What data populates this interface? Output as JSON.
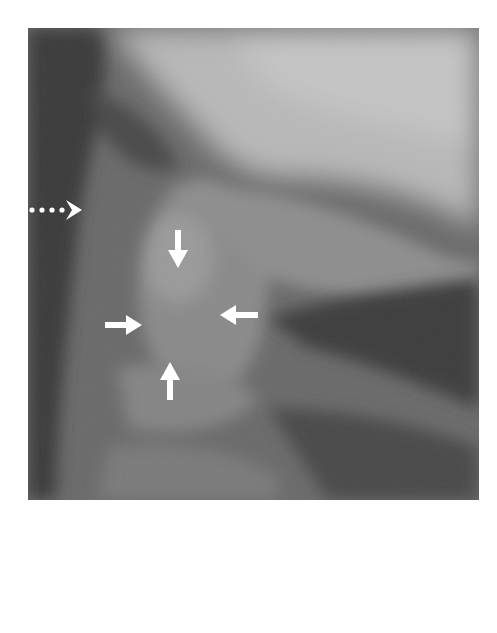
{
  "figure": {
    "type": "lateral cervical spine radiograph",
    "background": "#ffffff",
    "annotations": [
      {
        "kind": "dotted-arrow",
        "direction": "right"
      },
      {
        "kind": "arrow",
        "direction": "down"
      },
      {
        "kind": "arrow",
        "direction": "right"
      },
      {
        "kind": "arrow",
        "direction": "left"
      },
      {
        "kind": "arrow",
        "direction": "up"
      }
    ],
    "arrow_color": "#ffffff"
  }
}
